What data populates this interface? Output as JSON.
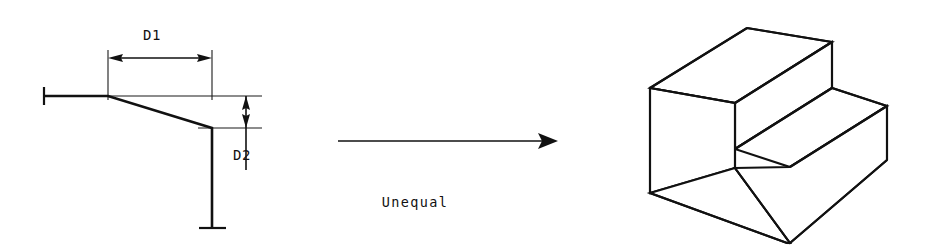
{
  "figure": {
    "type": "engineering-drawing",
    "background_color": "#ffffff",
    "line_color": "#111111"
  },
  "left_view": {
    "name": "profile-sketch",
    "dimensions": [
      {
        "id": "d1",
        "label": "D1",
        "orientation": "horizontal",
        "label_x": 160,
        "label_y": 43,
        "line_y": 58,
        "x_start": 108,
        "x_end": 212
      },
      {
        "id": "d2",
        "label": "D2",
        "orientation": "vertical",
        "label_x": 238,
        "label_y": 155,
        "line_x": 246,
        "y_start": 96,
        "y_end": 128
      }
    ],
    "profile": {
      "name": "profile-polyline",
      "points": "44,96 108,96 212,128 212,228",
      "left_tick": {
        "x": 44,
        "y": 96
      },
      "bottom_tick": {
        "x": 212,
        "y": 228
      }
    },
    "extension_lines": [
      {
        "id": "ext-left-vertical",
        "x1": 108,
        "y1": 50,
        "x2": 108,
        "y2": 100
      },
      {
        "id": "ext-right-vertical",
        "x1": 212,
        "y1": 50,
        "x2": 212,
        "y2": 100
      },
      {
        "id": "ext-top-horizontal",
        "x1": 108,
        "y1": 96,
        "x2": 262,
        "y2": 96
      },
      {
        "id": "ext-bottom-horizontal",
        "x1": 200,
        "y1": 128,
        "x2": 262,
        "y2": 128
      }
    ]
  },
  "transform_arrow": {
    "name": "transform-arrow",
    "x_start": 338,
    "x_end": 558,
    "y": 141,
    "caption": "Unequal",
    "caption_x": 415,
    "caption_y": 207
  },
  "right_view": {
    "name": "isometric-step-block",
    "description": "Isometric pictorial of an unequal two-step block",
    "faces": [
      {
        "id": "top-upper-face",
        "points": "650,88 747,28 832,42 735,103"
      },
      {
        "id": "upper-right-face",
        "points": "832,42 832,88 735,149 735,103"
      },
      {
        "id": "step-tread-face",
        "points": "735,130 832,88 887,106 790,166"
      },
      {
        "id": "front-left-face",
        "points": "650,88 735,103 735,168 650,193"
      },
      {
        "id": "lower-front-face",
        "points": "650,193 735,168 787,243 650,193"
      },
      {
        "id": "lower-right-face",
        "points": "790,166 887,106 887,160 790,243"
      }
    ],
    "edges": [
      {
        "id": "edge-top-left",
        "x1": 650,
        "y1": 88,
        "x2": 747,
        "y2": 28
      },
      {
        "id": "edge-top-back",
        "x1": 747,
        "y1": 28,
        "x2": 832,
        "y2": 42
      },
      {
        "id": "edge-top-front",
        "x1": 650,
        "y1": 88,
        "x2": 735,
        "y2": 103
      },
      {
        "id": "edge-top-crease",
        "x1": 735,
        "y1": 103,
        "x2": 832,
        "y2": 42
      },
      {
        "id": "edge-upper-right-vertical",
        "x1": 832,
        "y1": 42,
        "x2": 832,
        "y2": 88
      },
      {
        "id": "edge-riser-diagonal",
        "x1": 735,
        "y1": 149,
        "x2": 832,
        "y2": 88
      },
      {
        "id": "edge-riser-vertical",
        "x1": 735,
        "y1": 103,
        "x2": 735,
        "y2": 168
      },
      {
        "id": "edge-tread-front",
        "x1": 735,
        "y1": 168,
        "x2": 790,
        "y2": 243
      },
      {
        "id": "edge-tread-right",
        "x1": 832,
        "y1": 88,
        "x2": 887,
        "y2": 106
      },
      {
        "id": "edge-tread-diagonal",
        "x1": 790,
        "y1": 166,
        "x2": 887,
        "y2": 106
      },
      {
        "id": "edge-right-vertical",
        "x1": 887,
        "y1": 106,
        "x2": 887,
        "y2": 160
      },
      {
        "id": "edge-bottom-right",
        "x1": 790,
        "y1": 243,
        "x2": 887,
        "y2": 160
      },
      {
        "id": "edge-left-vertical",
        "x1": 650,
        "y1": 88,
        "x2": 650,
        "y2": 193
      },
      {
        "id": "edge-bottom-front",
        "x1": 650,
        "y1": 193,
        "x2": 787,
        "y2": 243
      },
      {
        "id": "edge-bottom-vertical",
        "x1": 787,
        "y1": 243,
        "x2": 790,
        "y2": 243
      }
    ]
  }
}
